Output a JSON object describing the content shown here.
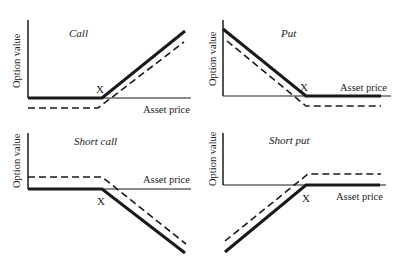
{
  "colors": {
    "ink": "#1a1a1a",
    "background": "#ffffff"
  },
  "panels": [
    {
      "id": "call",
      "title": "Call",
      "y_label": "Option value",
      "x_label": "Asset price",
      "strike_label": "X"
    },
    {
      "id": "put",
      "title": "Put",
      "y_label": "Option value",
      "x_label": "Asset price",
      "strike_label": "X"
    },
    {
      "id": "short-call",
      "title": "Short call",
      "y_label": "Option value",
      "x_label": "Asset price",
      "strike_label": "X"
    },
    {
      "id": "short-put",
      "title": "Short put",
      "y_label": "Option value",
      "x_label": "Asset price",
      "strike_label": "X"
    }
  ],
  "legend_semantics": {
    "solid_line": "Payoff",
    "dashed_line": "Profit (payoff net of premium)"
  }
}
